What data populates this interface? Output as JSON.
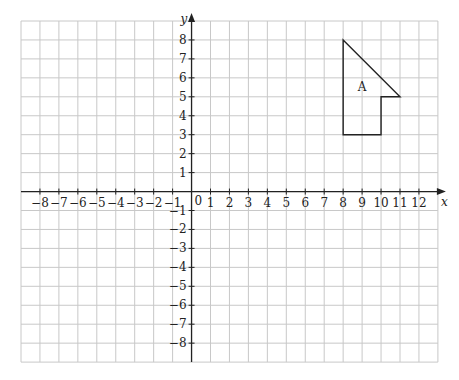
{
  "grid": {
    "x_min": -9,
    "x_max": 13,
    "y_min": -9,
    "y_max": 9,
    "left_px": 21,
    "top_px": 21,
    "cell_px": 18.95,
    "grid_color": "#c8c8c8",
    "axis_color": "#222222"
  },
  "axes": {
    "x_label": "x",
    "y_label": "y",
    "origin_label": "0",
    "x_ticks": [
      -8,
      -7,
      -6,
      -5,
      -4,
      -3,
      -2,
      -1,
      1,
      2,
      3,
      4,
      5,
      6,
      7,
      8,
      9,
      10,
      11,
      12
    ],
    "y_ticks": [
      8,
      7,
      6,
      5,
      4,
      3,
      2,
      1,
      -1,
      -2,
      -3,
      -4,
      -5,
      -6,
      -7,
      -8
    ]
  },
  "shapes": [
    {
      "label": "A",
      "label_pos": [
        9,
        5.5
      ],
      "vertices": [
        [
          8,
          8
        ],
        [
          11,
          5
        ],
        [
          10,
          5
        ],
        [
          10,
          3
        ],
        [
          8,
          3
        ]
      ],
      "stroke": "#222222"
    }
  ],
  "chart_data": {
    "type": "scatter",
    "title": "",
    "xlabel": "x",
    "ylabel": "y",
    "xlim": [
      -9,
      13
    ],
    "ylim": [
      -9,
      9
    ],
    "grid": true,
    "series": [
      {
        "name": "Shape A",
        "points": [
          [
            8,
            8
          ],
          [
            11,
            5
          ],
          [
            10,
            5
          ],
          [
            10,
            3
          ],
          [
            8,
            3
          ]
        ]
      }
    ]
  }
}
